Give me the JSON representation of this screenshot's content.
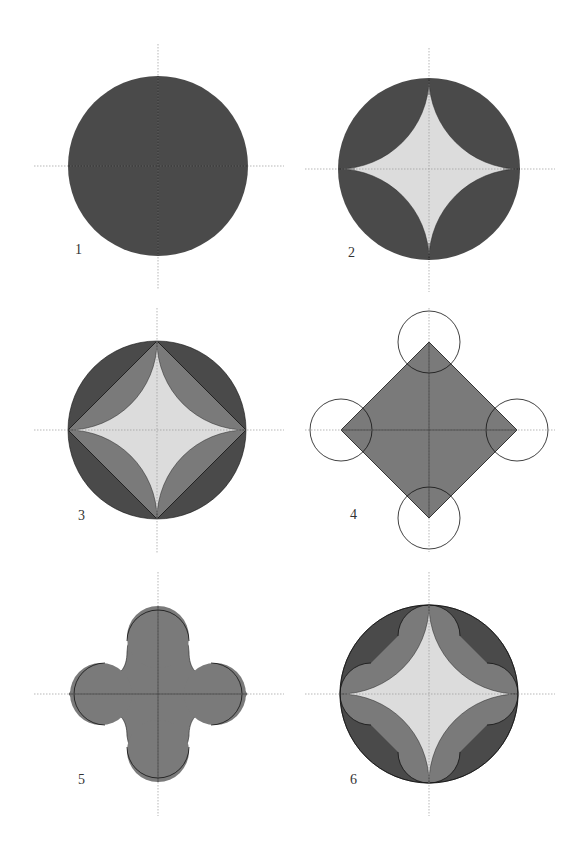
{
  "colors": {
    "dark": "#4a4a4a",
    "mid": "#7a7a7a",
    "light": "#dcdcdc",
    "line": "#111111",
    "axis": "#9a9a9a",
    "background": "#ffffff"
  },
  "figures": [
    {
      "label": "1",
      "description": "Filled dark circle with crosshair axes",
      "cx": 158,
      "cy": 166,
      "r": 90
    },
    {
      "label": "2",
      "description": "Dark circle with light concave astroid (four quarter-circle arcs cut from corners)",
      "cx": 429,
      "cy": 169,
      "r": 91
    },
    {
      "label": "3",
      "description": "Dark circle, mid-grey inscribed square (diamond) and light astroid inside",
      "cx": 157,
      "cy": 430,
      "r": 89
    },
    {
      "label": "4",
      "description": "Mid-grey diamond with four small circles at the vertices (outlined)",
      "cx": 429,
      "cy": 430,
      "r": 88
    },
    {
      "label": "5",
      "description": "Four-lobed rounded cross shape in mid grey",
      "cx": 158,
      "cy": 694,
      "r": 88
    },
    {
      "label": "6",
      "description": "Dark circle with mid-grey four-lobed band and light astroid center",
      "cx": 429,
      "cy": 694,
      "r": 89
    }
  ]
}
